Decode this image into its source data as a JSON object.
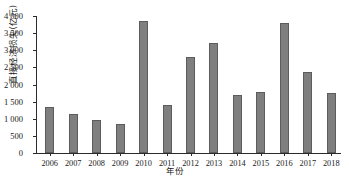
{
  "chart_data": {
    "type": "bar",
    "title": "",
    "xlabel": "年份",
    "ylabel": "直接经济损失(亿元)",
    "categories": [
      "2006",
      "2007",
      "2008",
      "2009",
      "2010",
      "2011",
      "2012",
      "2013",
      "2014",
      "2015",
      "2016",
      "2017",
      "2018"
    ],
    "values": [
      1350,
      1150,
      970,
      850,
      3850,
      1400,
      2800,
      3200,
      1700,
      1770,
      3790,
      2380,
      1760
    ],
    "ylim": [
      0,
      4000
    ],
    "ytick_values": [
      0,
      500,
      1000,
      1500,
      2000,
      2500,
      3000,
      3500,
      4000
    ],
    "ytick_labels": [
      "0",
      "500",
      "1 000",
      "1 500",
      "2 000",
      "2 500",
      "3 000",
      "3 500",
      "4 000"
    ],
    "grid": false,
    "legend": "none",
    "bar_color": "#7f7f7f",
    "bar_edge_color": "#5c5c5c",
    "axis_color": "#2b2b2b"
  }
}
